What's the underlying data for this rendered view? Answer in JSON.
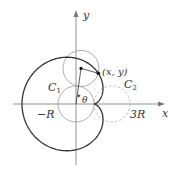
{
  "diagram": {
    "type": "cardioid-construction",
    "labels": {
      "y_axis": "y",
      "x_axis": "x",
      "point": "(x, y)",
      "fixed_circle": "C",
      "fixed_circle_sub": "1",
      "rolling_circle": "C",
      "rolling_circle_sub": "2",
      "angle": "θ",
      "neg_r": "−R",
      "three_r": "3R"
    },
    "colors": {
      "curve": "#333333",
      "axes": "#777777",
      "circles": "#999999",
      "dashed": "#aaaaaa"
    }
  }
}
